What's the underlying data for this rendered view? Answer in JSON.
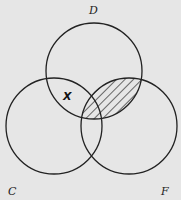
{
  "diagram": {
    "type": "venn",
    "sets": [
      {
        "id": "D",
        "label": "D",
        "cx": 94,
        "cy": 71,
        "r": 48
      },
      {
        "id": "C",
        "label": "C",
        "cx": 54,
        "cy": 126,
        "r": 48
      },
      {
        "id": "F",
        "label": "F",
        "cx": 129,
        "cy": 126,
        "r": 48
      }
    ],
    "labels": {
      "D": "D",
      "C": "C",
      "F": "F"
    },
    "marks": [
      {
        "region": "D∩C (not F)",
        "symbol": "X"
      }
    ],
    "shaded_region": "D∩F",
    "shading": "diagonal hatch",
    "colors": {
      "background": "#e6e6e6",
      "stroke": "#222222"
    }
  }
}
